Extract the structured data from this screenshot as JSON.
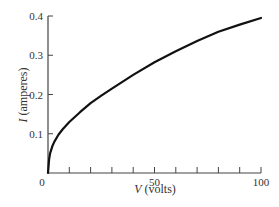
{
  "chart_data": {
    "type": "line",
    "title": "",
    "xlabel_var": "V",
    "xlabel_unit": " (volts)",
    "ylabel_var": "I",
    "ylabel_unit": " (amperes)",
    "xlim": [
      0,
      100
    ],
    "ylim": [
      0,
      0.4
    ],
    "x_ticks": [
      0,
      10,
      20,
      30,
      40,
      50,
      60,
      70,
      80,
      90,
      100
    ],
    "x_tick_labels": [
      {
        "value": 0,
        "label": "0"
      },
      {
        "value": 50,
        "label": "50"
      },
      {
        "value": 100,
        "label": "100"
      }
    ],
    "y_ticks": [
      0.1,
      0.2,
      0.3,
      0.4
    ],
    "y_tick_labels": [
      {
        "value": 0.1,
        "label": "0.1"
      },
      {
        "value": 0.2,
        "label": "0.2"
      },
      {
        "value": 0.3,
        "label": "0.3"
      },
      {
        "value": 0.4,
        "label": "0.4"
      }
    ],
    "grid": false,
    "legend": null,
    "series": [
      {
        "name": "I-V curve",
        "color": "#111111",
        "x": [
          0,
          0.5,
          1,
          2,
          3,
          5,
          7,
          10,
          15,
          20,
          25,
          30,
          40,
          50,
          60,
          70,
          80,
          90,
          100
        ],
        "y": [
          0,
          0.035,
          0.05,
          0.068,
          0.08,
          0.098,
          0.112,
          0.13,
          0.155,
          0.178,
          0.197,
          0.215,
          0.25,
          0.282,
          0.31,
          0.336,
          0.36,
          0.378,
          0.395
        ]
      }
    ]
  }
}
